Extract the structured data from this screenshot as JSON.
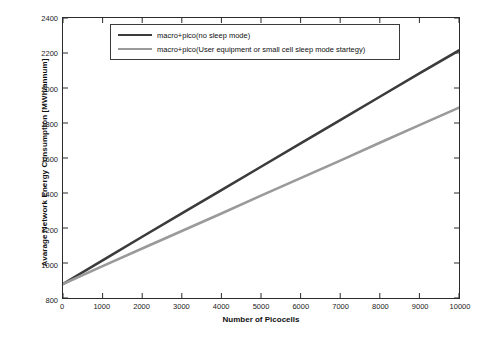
{
  "chart_data": {
    "type": "line",
    "title": "",
    "xlabel": "Number of Picocells",
    "ylabel": "Avarage Network Energy Consumption [MWh/annum]",
    "xlim": [
      0,
      10000
    ],
    "ylim": [
      800,
      2400
    ],
    "xticks": [
      0,
      1000,
      2000,
      3000,
      4000,
      5000,
      6000,
      7000,
      8000,
      9000,
      10000
    ],
    "yticks": [
      800,
      1000,
      1200,
      1400,
      1600,
      1800,
      2000,
      2200,
      2400
    ],
    "grid": false,
    "legend_position": "top-center",
    "series": [
      {
        "name": "macro+pico(no sleep mode)",
        "color": "#3b3b3b",
        "x": [
          0,
          1000,
          2000,
          3000,
          4000,
          5000,
          6000,
          7000,
          8000,
          9000,
          10000
        ],
        "values": [
          880,
          1015,
          1150,
          1283,
          1417,
          1550,
          1683,
          1817,
          1950,
          2083,
          2215
        ]
      },
      {
        "name": "macro+pico(User equipment or small cell sleep mode startegy)",
        "color": "#9a9a9a",
        "x": [
          0,
          1000,
          2000,
          3000,
          4000,
          5000,
          6000,
          7000,
          8000,
          9000,
          10000
        ],
        "values": [
          880,
          982,
          1083,
          1183,
          1283,
          1385,
          1485,
          1585,
          1687,
          1788,
          1888
        ]
      }
    ]
  }
}
